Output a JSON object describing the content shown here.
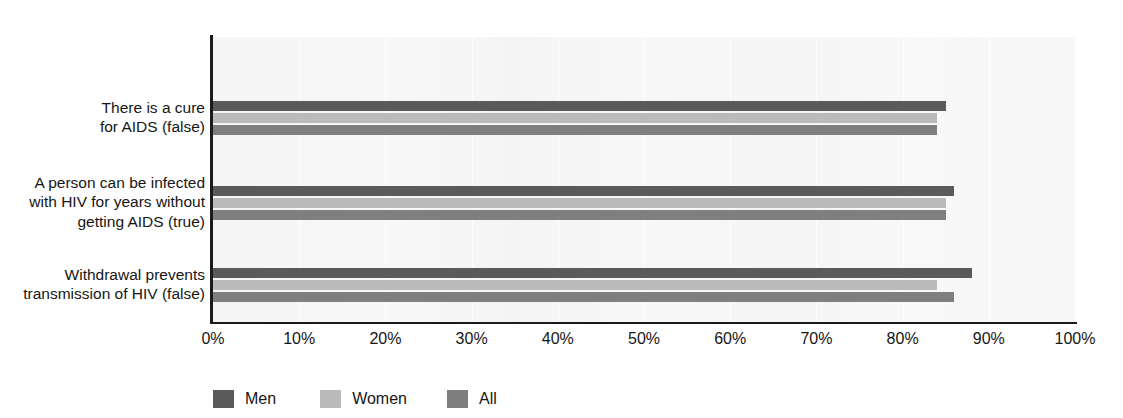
{
  "chart_data": {
    "type": "bar",
    "orientation": "horizontal",
    "title": "",
    "xlabel": "",
    "ylabel": "",
    "xlim": [
      0,
      100
    ],
    "xtick_labels": [
      "0%",
      "10%",
      "20%",
      "30%",
      "40%",
      "50%",
      "60%",
      "70%",
      "80%",
      "90%",
      "100%"
    ],
    "xticks": [
      0,
      10,
      20,
      30,
      40,
      50,
      60,
      70,
      80,
      90,
      100
    ],
    "grid": "vertical",
    "legend_position": "bottom-left",
    "categories": [
      "There is a cure\nfor AIDS (false)",
      "A person can be infected\nwith HIV for years without\ngetting AIDS (true)",
      "Withdrawal prevents\ntransmission of HIV (false)"
    ],
    "series": [
      {
        "name": "Men",
        "color": "#5a5a5a",
        "values": [
          85,
          86,
          88
        ]
      },
      {
        "name": "Women",
        "color": "#bababa",
        "values": [
          84,
          85,
          84
        ]
      },
      {
        "name": "All",
        "color": "#7f7f7f",
        "values": [
          84,
          85,
          86
        ]
      }
    ]
  },
  "legend": {
    "items": [
      {
        "label": "Men",
        "color": "#5a5a5a"
      },
      {
        "label": "Women",
        "color": "#bababa"
      },
      {
        "label": "All",
        "color": "#7f7f7f"
      }
    ]
  },
  "axis": {
    "x_ticks": [
      "0%",
      "10%",
      "20%",
      "30%",
      "40%",
      "50%",
      "60%",
      "70%",
      "80%",
      "90%",
      "100%"
    ]
  },
  "categories": {
    "labels": [
      "There is a cure\nfor AIDS (false)",
      "A person can be infected\nwith HIV for years without\ngetting AIDS (true)",
      "Withdrawal prevents\ntransmission of HIV (false)"
    ]
  },
  "colors": {
    "men": "#5a5a5a",
    "women": "#bababa",
    "all": "#7f7f7f",
    "plot_background": "#f6f6f6",
    "axis": "#1b1b1b"
  }
}
